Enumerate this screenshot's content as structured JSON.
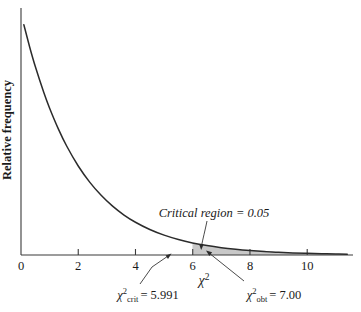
{
  "chart_data": {
    "type": "area",
    "title": "",
    "subtitle": "",
    "xlabel": "χ²",
    "ylabel": "Relative frequency",
    "xlim": [
      0,
      11.6
    ],
    "ylim": [
      0,
      0.5
    ],
    "grid": false,
    "legend": "none",
    "distribution": "chi-square",
    "degrees_of_freedom": 2,
    "x_ticks": [
      0,
      2,
      4,
      6,
      8,
      10
    ],
    "x_tick_labels": [
      "0",
      "2",
      "4",
      "6",
      "8",
      "10"
    ],
    "y_ticks": [],
    "y_tick_labels": [],
    "series": [
      {
        "name": "chi-square density (df = 2)",
        "x": [
          0.1,
          0.3,
          0.5,
          0.8,
          1.0,
          1.3,
          1.6,
          2.0,
          2.4,
          2.8,
          3.2,
          3.6,
          4.0,
          4.5,
          5.0,
          5.5,
          5.991,
          6.5,
          7.0,
          7.5,
          8.0,
          8.5,
          9.0,
          9.5,
          10.0,
          10.5,
          11.0,
          11.4
        ],
        "y": [
          0.4756,
          0.4304,
          0.3894,
          0.3352,
          0.3033,
          0.2612,
          0.2247,
          0.1839,
          0.1506,
          0.1233,
          0.1009,
          0.0826,
          0.0677,
          0.0527,
          0.041,
          0.032,
          0.025,
          0.0194,
          0.0151,
          0.0118,
          0.0092,
          0.0071,
          0.0056,
          0.0043,
          0.0034,
          0.0026,
          0.002,
          0.0017
        ]
      }
    ],
    "shaded_region": {
      "label": "Critical region = 0.05",
      "area": 0.05,
      "x_start": 5.991,
      "x_end": 11.6,
      "fill_color": "#c8c8c8"
    },
    "annotations": [
      {
        "name": "critical-region-label",
        "text": "Critical region = 0.05",
        "text_parts": {
          "phrase": "Critical region",
          "equals": "=",
          "value": "0.05"
        }
      },
      {
        "name": "chi-square-critical",
        "symbol": "χ",
        "superscript": "2",
        "subscript": "crit",
        "equals": "=",
        "value": "5.991",
        "text": "χ²crit = 5.991",
        "points_to_x": 6
      },
      {
        "name": "chi-square-obtained",
        "symbol": "χ",
        "superscript": "2",
        "subscript": "obt",
        "equals": "=",
        "value": "7.00",
        "text": "χ²obt = 7.00",
        "points_to_x": 7
      }
    ],
    "colors": {
      "curve": "#2b2b2b",
      "axis": "#3a3a3a",
      "shaded_region": "#c8c8c8",
      "text": "#1a1a1a",
      "background": "#ffffff"
    }
  },
  "axes": {
    "x_title": "χ",
    "x_title_sup": "2",
    "y_title": "Relative frequency",
    "tick_labels": [
      "0",
      "2",
      "4",
      "6",
      "8",
      "10"
    ]
  },
  "labels": {
    "critical_region": "Critical region = 0.05",
    "crit_symbol": "χ",
    "crit_sup": "2",
    "crit_sub": "crit",
    "crit_eq": "= 5.991",
    "obt_symbol": "χ",
    "obt_sup": "2",
    "obt_sub": "obt",
    "obt_eq": "= 7.00"
  }
}
